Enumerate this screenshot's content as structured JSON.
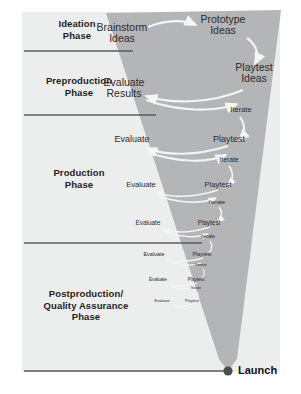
{
  "diagram": {
    "title_hidden": "",
    "colors": {
      "funnel": "#b4b5b6",
      "background_box": "#eceded",
      "divider": "#5b5b5f",
      "arrow": "#f4f4f4",
      "text": "#2b2b2b",
      "launch_dot": "#4c4c4e"
    },
    "phases": [
      {
        "id": "ideation",
        "label": "Ideation\nPhase"
      },
      {
        "id": "preproduction",
        "label": "Preproduction\nPhase"
      },
      {
        "id": "production",
        "label": "Production\nPhase"
      },
      {
        "id": "postproduction",
        "label": "Postproduction/\nQuality Assurance\nPhase"
      }
    ],
    "phase_labels": {
      "ideation_line1": "Ideation",
      "ideation_line2": "Phase",
      "preproduction_line1": "Preproduction",
      "preproduction_line2": "Phase",
      "production_line1": "Production",
      "production_line2": "Phase",
      "postproduction_line1": "Postproduction/",
      "postproduction_line2": "Quality Assurance",
      "postproduction_line3": "Phase"
    },
    "nodes": [
      {
        "id": "brainstorm-ideas",
        "line1": "Brainstorm",
        "line2": "Ideas",
        "size": 10.5
      },
      {
        "id": "prototype-ideas",
        "line1": "Prototype",
        "line2": "Ideas",
        "size": 10.5
      },
      {
        "id": "playtest-ideas",
        "line1": "Playtest",
        "line2": "Ideas",
        "size": 10.5
      },
      {
        "id": "evaluate-results",
        "line1": "Evaluate",
        "line2": "Results",
        "size": 10.5
      },
      {
        "id": "iterate-1",
        "line1": "Iterate",
        "line2": "",
        "size": 7.5
      },
      {
        "id": "evaluate-1",
        "line1": "Evaluate",
        "line2": "",
        "size": 9.0
      },
      {
        "id": "playtest-1",
        "line1": "Playtest",
        "line2": "",
        "size": 9.0
      },
      {
        "id": "iterate-2",
        "line1": "Iterate",
        "line2": "",
        "size": 6.8
      },
      {
        "id": "evaluate-2",
        "line1": "Evaluate",
        "line2": "",
        "size": 7.6
      },
      {
        "id": "playtest-2",
        "line1": "Playtest",
        "line2": "",
        "size": 7.6
      },
      {
        "id": "iterate-3",
        "line1": "Iterate",
        "line2": "",
        "size": 5.8
      },
      {
        "id": "evaluate-3",
        "line1": "Evaluate",
        "line2": "",
        "size": 6.4
      },
      {
        "id": "playtest-3",
        "line1": "Playtest",
        "line2": "",
        "size": 6.4
      },
      {
        "id": "iterate-4",
        "line1": "Iterate",
        "line2": "",
        "size": 5.0
      },
      {
        "id": "evaluate-4",
        "line1": "Evaluate",
        "line2": "",
        "size": 5.4
      },
      {
        "id": "playtest-4",
        "line1": "Playtest",
        "line2": "",
        "size": 5.4
      },
      {
        "id": "iterate-5",
        "line1": "Iterate",
        "line2": "",
        "size": 4.2
      },
      {
        "id": "evaluate-5",
        "line1": "Evaluate",
        "line2": "",
        "size": 4.6
      },
      {
        "id": "playtest-5",
        "line1": "Playtest",
        "line2": "",
        "size": 4.6
      },
      {
        "id": "iterate-6",
        "line1": "Iterate",
        "line2": "",
        "size": 3.6
      },
      {
        "id": "evaluate-6",
        "line1": "Evaluate",
        "line2": "",
        "size": 3.9
      },
      {
        "id": "playtest-6",
        "line1": "Playtest",
        "line2": "",
        "size": 3.9
      }
    ],
    "node_text": {
      "brainstorm_l1": "Brainstorm",
      "brainstorm_l2": "Ideas",
      "prototype_l1": "Prototype",
      "prototype_l2": "Ideas",
      "playtest_ideas_l1": "Playtest",
      "playtest_ideas_l2": "Ideas",
      "evaluate_results_l1": "Evaluate",
      "evaluate_results_l2": "Results",
      "iterate_1": "Iterate",
      "evaluate_1": "Evaluate",
      "playtest_1": "Playtest",
      "iterate_2": "Iterate",
      "evaluate_2": "Evaluate",
      "playtest_2": "Playtest",
      "iterate_3": "Iterate",
      "evaluate_3": "Evaluate",
      "playtest_3": "Playtest",
      "iterate_4": "Iterate",
      "evaluate_4": "Evaluate",
      "playtest_4": "Playtest",
      "iterate_5": "Iterate",
      "evaluate_5": "Evaluate",
      "playtest_5": "Playtest",
      "iterate_6": "Iterate",
      "evaluate_6": "Evaluate",
      "playtest_6": "Playtest"
    },
    "endpoint": {
      "label": "Launch"
    }
  }
}
